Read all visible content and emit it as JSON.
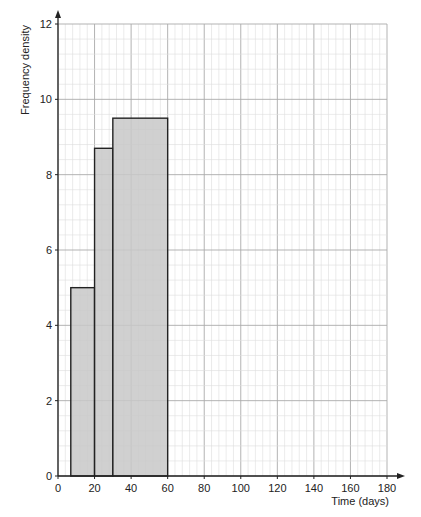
{
  "chart_data": {
    "type": "bar",
    "subtype": "histogram",
    "title": "",
    "xlabel": "Time (days)",
    "ylabel": "Frequency density",
    "xlim": [
      0,
      180
    ],
    "ylim": [
      0,
      12
    ],
    "xticks": [
      0,
      20,
      40,
      60,
      80,
      100,
      120,
      140,
      160,
      180
    ],
    "yticks": [
      0,
      2,
      4,
      6,
      8,
      10,
      12
    ],
    "grid": true,
    "bins": [
      {
        "x_start": 7,
        "x_end": 20,
        "frequency_density": 5.0
      },
      {
        "x_start": 20,
        "x_end": 30,
        "frequency_density": 8.7
      },
      {
        "x_start": 30,
        "x_end": 60,
        "frequency_density": 9.5
      }
    ],
    "bar_color": "#c8c8c8",
    "edge_color": "#222222"
  }
}
